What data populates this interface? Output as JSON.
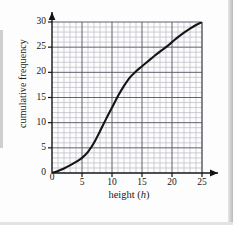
{
  "figure": {
    "background_color": "#fdfdfd",
    "ink_color": "#141414",
    "grid_minor_color": "#b9b9c4",
    "grid_major_color": "#5a5a66",
    "curve_color": "#141414"
  },
  "chart_data": {
    "type": "line",
    "title": "",
    "subtitle": "",
    "xlabel": "height (h)",
    "xlabel_plain": "height",
    "xlabel_variable": "h",
    "ylabel": "cumulative frequency",
    "xlim": [
      0,
      26
    ],
    "ylim": [
      0,
      31
    ],
    "x_major_ticks": [
      0,
      5,
      10,
      15,
      20,
      25
    ],
    "x_tick_labels": [
      "0",
      "5",
      "10",
      "15",
      "20",
      "25"
    ],
    "y_major_ticks": [
      0,
      5,
      10,
      15,
      20,
      25,
      30
    ],
    "y_tick_labels": [
      "0",
      "5",
      "10",
      "15",
      "20",
      "25",
      "30"
    ],
    "x_minor_step": 1,
    "y_minor_step": 1,
    "grid": true,
    "grid_style": "minor every 1 unit, major every 5 units",
    "legend": false,
    "legend_position": "none",
    "axis_arrows": true,
    "series": [
      {
        "name": "cumulative frequency curve",
        "style": "smooth ogive",
        "x": [
          0,
          1,
          2,
          3,
          4,
          5,
          6,
          7,
          8,
          9,
          10,
          11,
          12,
          13,
          14,
          15,
          16,
          17,
          18,
          19,
          20,
          21,
          22,
          23,
          24,
          25
        ],
        "values": [
          0,
          0.4,
          0.9,
          1.5,
          2.2,
          3.0,
          4.2,
          6.0,
          8.3,
          10.7,
          13.0,
          15.3,
          17.3,
          19.0,
          20.2,
          21.2,
          22.2,
          23.2,
          24.1,
          25.0,
          26.0,
          27.0,
          27.9,
          28.7,
          29.4,
          30.0
        ]
      }
    ],
    "key_points": [
      {
        "x": 0,
        "y": 0
      },
      {
        "x": 5,
        "y": 3
      },
      {
        "x": 10,
        "y": 13
      },
      {
        "x": 15,
        "y": 21
      },
      {
        "x": 20,
        "y": 26
      },
      {
        "x": 25,
        "y": 30
      }
    ]
  }
}
